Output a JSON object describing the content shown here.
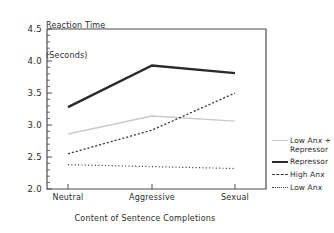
{
  "chart_data": {
    "type": "line",
    "title": "",
    "xlabel": "Content of Sentence Completions",
    "ylabel": "Reaction Time\n(Seconds)",
    "ylabel_line1": "Reaction Time",
    "ylabel_line2": "(Seconds)",
    "categories": [
      "Neutral",
      "Aggressive",
      "Sexual"
    ],
    "ylim": [
      2.0,
      4.5
    ],
    "ytick_labels": [
      "2.0",
      "2.5",
      "3.0",
      "3.5",
      "4.0",
      "4.5"
    ],
    "ytick_values": [
      2.0,
      2.5,
      3.0,
      3.5,
      4.0,
      4.5
    ],
    "minor_ticks_per_interval": 5,
    "grid": false,
    "legend_position": "right",
    "series": [
      {
        "name": "Low Anx +\nRepressor",
        "name_line1": "Low Anx +",
        "name_line2": "Repressor",
        "values": [
          2.86,
          3.14,
          3.06
        ],
        "color": "#c9c9c9",
        "style": "solid",
        "width": 1.4
      },
      {
        "name": "Repressor",
        "values": [
          3.28,
          3.93,
          3.81
        ],
        "color": "#2a2a2a",
        "style": "solid",
        "width": 2.4
      },
      {
        "name": "High Anx",
        "values": [
          2.55,
          2.92,
          3.5
        ],
        "color": "#3a3a3a",
        "style": "dashed",
        "width": 1.3
      },
      {
        "name": "Low Anx",
        "values": [
          2.38,
          2.35,
          2.32
        ],
        "color": "#3a3a3a",
        "style": "dotted",
        "width": 1.2
      }
    ]
  },
  "axis": {
    "y_title_line1": "Reaction Time",
    "y_title_line2": "(Seconds)",
    "x_title": "Content of Sentence Completions",
    "ytick_0": "2.0",
    "ytick_1": "2.5",
    "ytick_2": "3.0",
    "ytick_3": "3.5",
    "ytick_4": "4.0",
    "ytick_5": "4.5",
    "xtick_0": "Neutral",
    "xtick_1": "Aggressive",
    "xtick_2": "Sexual"
  },
  "legend": {
    "item_0_line1": "Low Anx +",
    "item_0_line2": "Repressor",
    "item_1": "Repressor",
    "item_2": "High Anx",
    "item_3": "Low Anx"
  },
  "colors": {
    "frame": "#4d4d4d",
    "text": "#2b2b2b",
    "series_low_anx_repressor": "#c9c9c9",
    "series_repressor": "#2a2a2a",
    "series_high_anx": "#3a3a3a",
    "series_low_anx": "#3a3a3a"
  }
}
